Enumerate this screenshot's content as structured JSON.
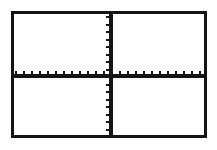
{
  "screen": {
    "width": 217,
    "height": 150,
    "background_color": "#FFFFFF",
    "description": "Graphing calculator viewport showing an empty coordinate plane"
  },
  "frame": {
    "name": "plot-frame",
    "x": 11,
    "y": 11,
    "width": 196,
    "height": 127,
    "border_width": 3,
    "border_color": "#141414",
    "fill_color": "#FFFFFF"
  },
  "chart_data": {
    "type": "scatter",
    "title": "",
    "subtitle": "",
    "xlabel": "",
    "ylabel": "",
    "series": [],
    "x": [],
    "values": [],
    "grid": false,
    "legend": "none",
    "axis_style": "cartesian-crosshair",
    "origin_pixel": {
      "x": 97,
      "y": 62
    },
    "xlim": [
      -12,
      12
    ],
    "ylim": [
      -8,
      8
    ],
    "x_axis": {
      "name": "x-axis",
      "visible": true,
      "color": "#141414",
      "line_thickness": 3,
      "y_pixel": 62,
      "start_pixel_x": 0,
      "end_pixel_x": 190,
      "tick_count": 24,
      "tick_spacing_px": 8,
      "tick_length_px": 4,
      "tick_direction": "up",
      "tick_labels": [],
      "tick_values": [
        -12,
        -11,
        -10,
        -9,
        -8,
        -7,
        -6,
        -5,
        -4,
        -3,
        -2,
        -1,
        1,
        2,
        3,
        4,
        5,
        6,
        7,
        8,
        9,
        10,
        11,
        12
      ]
    },
    "y_axis": {
      "name": "y-axis",
      "visible": true,
      "color": "#141414",
      "line_thickness": 3,
      "x_pixel": 97,
      "start_pixel_y": 0,
      "end_pixel_y": 121,
      "tick_count": 16,
      "tick_spacing_px": 7.5,
      "tick_length_px": 4,
      "tick_direction": "left",
      "tick_labels": [],
      "tick_values": [
        -8,
        -7,
        -6,
        -5,
        -4,
        -3,
        -2,
        -1,
        1,
        2,
        3,
        4,
        5,
        6,
        7,
        8
      ]
    },
    "quadrants": [
      {
        "name": "quadrant-ii",
        "label": ""
      },
      {
        "name": "quadrant-i",
        "label": ""
      },
      {
        "name": "quadrant-iii",
        "label": ""
      },
      {
        "name": "quadrant-iv",
        "label": ""
      }
    ]
  }
}
